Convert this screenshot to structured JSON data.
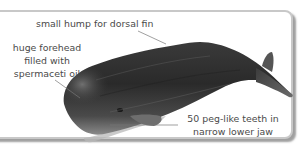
{
  "diagram": {
    "labels": {
      "dorsal": {
        "lines": [
          "small hump for dorsal fin"
        ]
      },
      "forehead": {
        "lines": [
          "huge forehead",
          "filled with",
          "spermaceti oil"
        ]
      },
      "teeth": {
        "lines": [
          "50 peg-like teeth in",
          "narrow lower jaw"
        ]
      }
    },
    "colors": {
      "frame_border": "#c8c8c8",
      "text": "#4a4a4a",
      "leader_line": "#666666",
      "whale_dark": "#2a2a2a",
      "whale_mid": "#555555",
      "whale_light": "#9a9a9a"
    }
  }
}
